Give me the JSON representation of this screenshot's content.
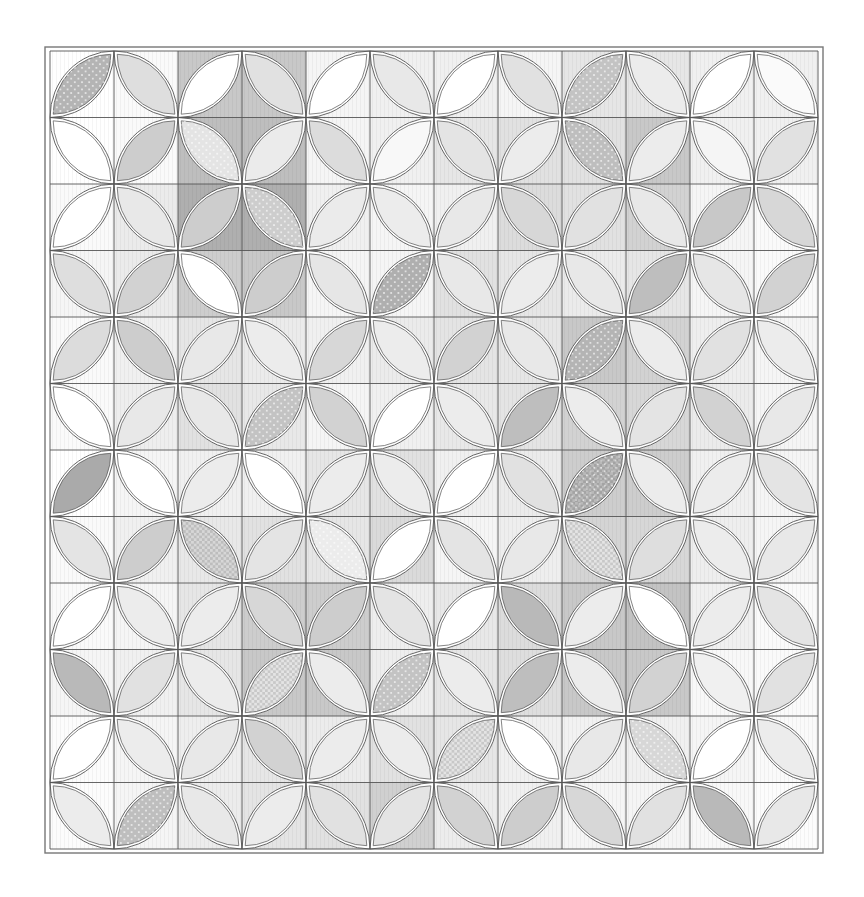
{
  "figure": {
    "type": "quilt-pattern",
    "label": "Orange peel quilt block layout",
    "rows": 12,
    "cols": 12,
    "outer_frame": {
      "x": 45,
      "y": 47,
      "w": 778,
      "h": 806
    },
    "grid": {
      "x": 50,
      "y": 51,
      "w": 768,
      "h": 798
    },
    "colors": {
      "line": "#555555",
      "frame": "#777777",
      "white": "#ffffff"
    },
    "petal_shades": [
      [
        180,
        222,
        255,
        225,
        255,
        232,
        255,
        225,
        195,
        236,
        255,
        250
      ],
      [
        255,
        205,
        228,
        235,
        220,
        248,
        228,
        236,
        190,
        236,
        245,
        225
      ],
      [
        255,
        232,
        205,
        205,
        235,
        236,
        232,
        215,
        225,
        232,
        200,
        215
      ],
      [
        222,
        210,
        255,
        205,
        230,
        175,
        232,
        236,
        232,
        190,
        230,
        210
      ],
      [
        220,
        205,
        232,
        236,
        215,
        236,
        210,
        232,
        180,
        236,
        225,
        236
      ],
      [
        255,
        232,
        232,
        195,
        210,
        255,
        236,
        190,
        236,
        228,
        210,
        232
      ],
      [
        170,
        255,
        236,
        255,
        236,
        236,
        255,
        225,
        185,
        236,
        236,
        228
      ],
      [
        228,
        205,
        215,
        228,
        236,
        255,
        228,
        232,
        228,
        222,
        236,
        232
      ],
      [
        255,
        236,
        236,
        215,
        205,
        228,
        255,
        185,
        236,
        255,
        236,
        228
      ],
      [
        185,
        225,
        236,
        228,
        236,
        195,
        236,
        190,
        236,
        210,
        240,
        225
      ],
      [
        255,
        236,
        232,
        210,
        236,
        236,
        228,
        255,
        232,
        215,
        255,
        236
      ],
      [
        236,
        190,
        232,
        236,
        225,
        228,
        210,
        205,
        215,
        225,
        185,
        232
      ]
    ],
    "background_shades": [
      [
        255,
        250,
        200,
        200,
        245,
        240,
        240,
        245,
        230,
        230,
        240,
        240
      ],
      [
        255,
        250,
        190,
        190,
        245,
        240,
        230,
        225,
        225,
        200,
        240,
        240
      ],
      [
        250,
        235,
        175,
        175,
        240,
        245,
        240,
        220,
        225,
        210,
        245,
        250
      ],
      [
        245,
        235,
        205,
        200,
        245,
        245,
        225,
        230,
        235,
        230,
        245,
        250
      ],
      [
        250,
        240,
        230,
        235,
        240,
        235,
        228,
        230,
        200,
        210,
        238,
        245
      ],
      [
        250,
        238,
        225,
        232,
        245,
        240,
        232,
        228,
        210,
        215,
        235,
        245
      ],
      [
        255,
        245,
        240,
        240,
        230,
        225,
        240,
        235,
        205,
        205,
        240,
        245
      ],
      [
        250,
        240,
        232,
        225,
        230,
        218,
        245,
        238,
        212,
        215,
        238,
        245
      ],
      [
        250,
        245,
        230,
        205,
        205,
        238,
        232,
        220,
        200,
        195,
        240,
        250
      ],
      [
        245,
        240,
        230,
        200,
        200,
        238,
        230,
        222,
        200,
        200,
        248,
        250
      ],
      [
        252,
        245,
        238,
        230,
        236,
        225,
        230,
        240,
        242,
        240,
        245,
        250
      ],
      [
        252,
        245,
        236,
        228,
        225,
        208,
        236,
        240,
        245,
        245,
        248,
        252
      ]
    ],
    "patterns": {
      "dots": [
        [
          0,
          0
        ],
        [
          1,
          2
        ],
        [
          2,
          3
        ],
        [
          3,
          5
        ],
        [
          4,
          8
        ],
        [
          5,
          3
        ],
        [
          6,
          8
        ],
        [
          7,
          4
        ],
        [
          9,
          5
        ],
        [
          11,
          1
        ],
        [
          10,
          9
        ],
        [
          0,
          8
        ],
        [
          1,
          8
        ]
      ],
      "checks": [
        [
          7,
          2
        ],
        [
          9,
          3
        ],
        [
          10,
          6
        ],
        [
          6,
          8
        ],
        [
          7,
          8
        ]
      ]
    }
  }
}
